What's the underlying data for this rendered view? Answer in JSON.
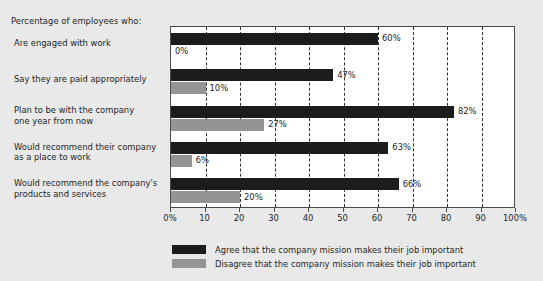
{
  "chart_data": {
    "type": "bar",
    "orientation": "horizontal",
    "title": "Percentage of employees who:",
    "xlabel": "",
    "ylabel": "",
    "xlim": [
      0,
      100
    ],
    "grid": true,
    "legend_position": "bottom",
    "categories": [
      "Are engaged with work",
      "Say they are paid appropriately",
      "Plan to be with the company one year from now",
      "Would recommend their company as a place to work",
      "Would recommend the company's products and services"
    ],
    "category_lines": [
      [
        "Are engaged with work"
      ],
      [
        "Say they are paid appropriately"
      ],
      [
        "Plan to be with the company",
        "one year from now"
      ],
      [
        "Would recommend their company",
        "as a place to work"
      ],
      [
        "Would recommend the company's",
        "products and services"
      ]
    ],
    "series": [
      {
        "name": "Agree that the company mission makes their job important",
        "color": "#1c1c1c",
        "values": [
          60,
          47,
          82,
          63,
          66
        ],
        "labels": [
          "60%",
          "47%",
          "82%",
          "63%",
          "66%"
        ]
      },
      {
        "name": "Disagree that the company mission makes their job important",
        "color": "#949494",
        "values": [
          0,
          10,
          27,
          6,
          20
        ],
        "labels": [
          "0%",
          "10%",
          "27%",
          "6%",
          "20%"
        ]
      }
    ],
    "xticks": [
      0,
      10,
      20,
      30,
      40,
      50,
      60,
      70,
      80,
      90,
      100
    ],
    "xtick_labels": [
      "0%",
      "10",
      "20",
      "30",
      "40",
      "50",
      "60",
      "70",
      "80",
      "90",
      "100%"
    ]
  },
  "legend": {
    "items": [
      {
        "label": "Agree that the company mission makes their job important",
        "color": "#1c1c1c"
      },
      {
        "label": "Disagree that the company mission makes their job important",
        "color": "#949494"
      }
    ]
  },
  "colors": {
    "background": "#e9e9e9",
    "plot_background": "#ffffff",
    "axis": "#4a4a4a",
    "gridline": "#2f2f2f",
    "agree": "#1c1c1c",
    "disagree": "#949494",
    "text": "#1d1d1d"
  }
}
